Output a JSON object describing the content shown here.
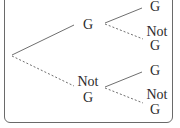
{
  "tree": {
    "level1": {
      "upper": {
        "label": "G",
        "line": "solid"
      },
      "lower": {
        "label_line1": "Not",
        "label_line2": "G",
        "line": "dashed"
      }
    },
    "level2": {
      "from_g": {
        "upper": {
          "label": "G",
          "line": "solid"
        },
        "lower": {
          "label_line1": "Not",
          "label_line2": "G",
          "line": "dashed"
        }
      },
      "from_not_g": {
        "upper": {
          "label": "G",
          "line": "solid"
        },
        "lower": {
          "label_line1": "Not",
          "label_line2": "G",
          "line": "dashed"
        }
      }
    }
  },
  "colors": {
    "line": "#6f6f6f",
    "text": "#2b2b2b",
    "border": "#6a6a6a"
  }
}
